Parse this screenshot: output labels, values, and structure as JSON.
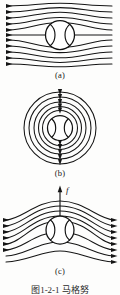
{
  "figure": {
    "caption": "图1-2-1  马格努",
    "ball_style": "baseball-seam",
    "line_color": "#151515",
    "ball_fill": "#ffffff",
    "background": "#fdfdfc"
  },
  "panels": [
    {
      "id": "a",
      "label": "(a)",
      "description": "Uniform horizontal flow past a stationary ball",
      "flow_direction": "left-to-right",
      "streamline_count": 9,
      "arrowheads": "left-edge",
      "has_force_arrow": false
    },
    {
      "id": "b",
      "label": "(b)",
      "description": "Circulation around a spinning ball, concentric closed streamlines",
      "flow_direction": "circulation",
      "streamline_count": 6,
      "arrowheads": "top-center-downward",
      "has_force_arrow": false
    },
    {
      "id": "c",
      "label": "(c)",
      "description": "Superposed flow producing the Magnus lift force",
      "flow_direction": "left-to-right",
      "streamline_count": 9,
      "arrowheads": "right-edge",
      "has_force_arrow": true,
      "force_label": "f"
    }
  ]
}
